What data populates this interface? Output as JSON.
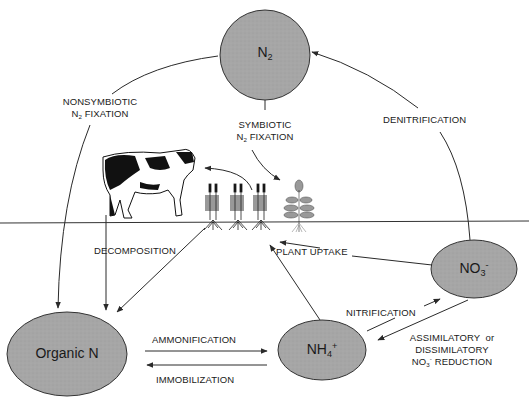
{
  "diagram": {
    "nodes": {
      "n2": {
        "label": "N",
        "sub": "2"
      },
      "organic_n": {
        "label": "Organic N"
      },
      "nh4": {
        "label": "NH",
        "sub": "4",
        "sup": "+"
      },
      "no3": {
        "label": "NO",
        "sub": "3",
        "sup": "-"
      }
    },
    "processes": {
      "nonsymbiotic_line1": "NONSYMBIOTIC",
      "nonsymbiotic_line2_pre": "N",
      "nonsymbiotic_line2_sub": "2",
      "nonsymbiotic_line2_post": " FIXATION",
      "symbiotic_line1": "SYMBIOTIC",
      "symbiotic_line2_pre": "N",
      "symbiotic_line2_sub": "2",
      "symbiotic_line2_post": " FIXATION",
      "denitrification": "DENITRIFICATION",
      "decomposition": "DECOMPOSITION",
      "plant_uptake": "PLANT UPTAKE",
      "nitrification": "NITRIFICATION",
      "reduction_line1": "ASSIMILATORY  or",
      "reduction_line2": "DISSIMILATORY",
      "reduction_line3_pre": "NO",
      "reduction_line3_sub": "3",
      "reduction_line3_sup": "-",
      "reduction_line3_post": " REDUCTION",
      "ammonification": "AMMONIFICATION",
      "immobilization": "IMMOBILIZATION"
    },
    "colors": {
      "node_fill": "#a6a6a6",
      "node_stroke": "#333333",
      "line": "#2a2a2a",
      "ground": "#333333",
      "background": "#ffffff"
    },
    "illustrations": [
      "cow",
      "legume-plants",
      "leafy-plant"
    ]
  }
}
